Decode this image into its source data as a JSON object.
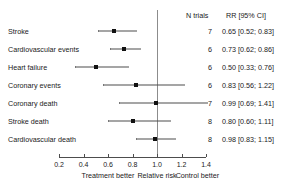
{
  "chart_data": {
    "type": "forest",
    "title": "",
    "xlabel": "Relative risk",
    "ylabel": "",
    "xlim": [
      0.2,
      1.4
    ],
    "xticks": [
      "0.2",
      "0.4",
      "0.6",
      "0.8",
      "1.0",
      "1.2",
      "1.4"
    ],
    "xtick_values": [
      0.2,
      0.4,
      0.6,
      0.8,
      1.0,
      1.2,
      1.4
    ],
    "reference_line": 1.0,
    "grid": false,
    "columns": {
      "outcome": "",
      "n_trials": "N trials",
      "effect": "RR [95% CI]"
    },
    "axis_captions": {
      "left": "Treatment better",
      "center": "Relative risk",
      "right": "Control better"
    },
    "rows": [
      {
        "label": "Stroke",
        "n_trials": "7",
        "effect_text": "0.65 [0.52; 0.83]",
        "estimate": 0.65,
        "ci_low": 0.52,
        "ci_high": 0.83
      },
      {
        "label": "Cardiovascular events",
        "n_trials": "6",
        "effect_text": "0.73 [0.62; 0.86]",
        "estimate": 0.73,
        "ci_low": 0.62,
        "ci_high": 0.86
      },
      {
        "label": "Heart failure",
        "n_trials": "6",
        "effect_text": "0.50 [0.33; 0.76]",
        "estimate": 0.5,
        "ci_low": 0.33,
        "ci_high": 0.76
      },
      {
        "label": "Coronary events",
        "n_trials": "6",
        "effect_text": "0.83 [0.56; 1.22]",
        "estimate": 0.83,
        "ci_low": 0.56,
        "ci_high": 1.22
      },
      {
        "label": "Coronary death",
        "n_trials": "7",
        "effect_text": "0.99 [0.69; 1.41]",
        "estimate": 0.99,
        "ci_low": 0.69,
        "ci_high": 1.41
      },
      {
        "label": "Stroke death",
        "n_trials": "8",
        "effect_text": "0.80 [0.60; 1.11]",
        "estimate": 0.8,
        "ci_low": 0.6,
        "ci_high": 1.11
      },
      {
        "label": "Cardiovascular death",
        "n_trials": "8",
        "effect_text": "0.98 [0.83; 1.15]",
        "estimate": 0.98,
        "ci_low": 0.83,
        "ci_high": 1.15
      }
    ]
  }
}
